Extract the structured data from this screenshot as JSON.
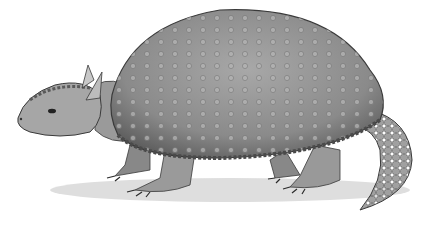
{
  "image": {
    "subject": "glyptodont illustration",
    "style": "grayscale pencil drawing",
    "colors": {
      "background": "#ffffff",
      "shell": "#8a8a8a",
      "shell_dark": "#5a5a5a",
      "skin": "#9c9c9c",
      "ground": "#cfcfcf",
      "outline": "#3a3a3a"
    }
  }
}
